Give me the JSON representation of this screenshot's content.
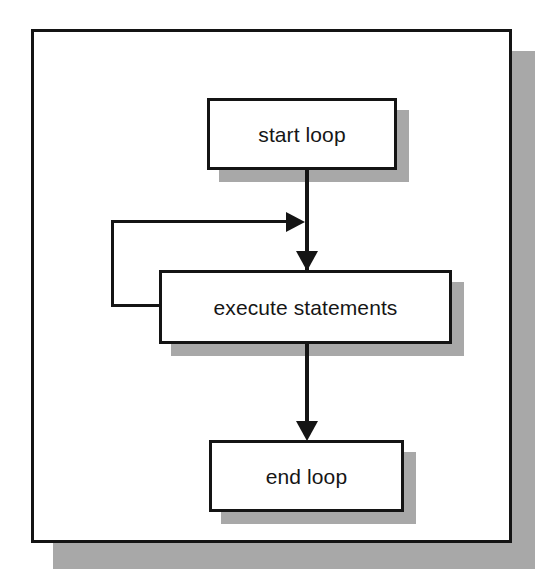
{
  "diagram": {
    "type": "flowchart",
    "colors": {
      "stroke": "#141414",
      "fill": "#ffffff",
      "shadow": "#a8a8a8",
      "background": "#ffffff"
    },
    "frame": {
      "name": "diagram-frame",
      "has_drop_shadow": true
    },
    "nodes": [
      {
        "id": "start-loop",
        "label": "start loop",
        "shape": "rectangle",
        "has_drop_shadow": true
      },
      {
        "id": "execute-statements",
        "label": "execute statements",
        "shape": "rectangle",
        "has_drop_shadow": true
      },
      {
        "id": "end-loop",
        "label": "end loop",
        "shape": "rectangle",
        "has_drop_shadow": true
      }
    ],
    "edges": [
      {
        "id": "start-to-execute",
        "from": "start-loop",
        "to": "execute-statements",
        "arrow": "down",
        "label": ""
      },
      {
        "id": "execute-to-end",
        "from": "execute-statements",
        "to": "end-loop",
        "arrow": "down",
        "label": ""
      },
      {
        "id": "execute-feedback",
        "from": "execute-statements",
        "to": "execute-statements",
        "arrow": "right",
        "routing": "left-loop-back",
        "label": ""
      }
    ]
  }
}
